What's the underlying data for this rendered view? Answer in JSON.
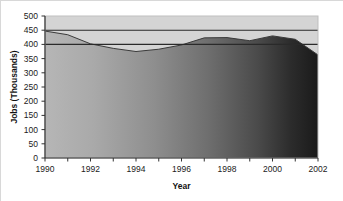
{
  "chart_data": {
    "type": "area",
    "title": "",
    "xlabel": "Year",
    "ylabel": "Jobs (Thousands)",
    "xlim": [
      1990,
      2002
    ],
    "ylim": [
      0,
      500
    ],
    "grid": false,
    "legend": "none",
    "x": [
      1990,
      1991,
      1992,
      1993,
      1994,
      1995,
      1996,
      1997,
      1998,
      1999,
      2000,
      2001,
      2002
    ],
    "values": [
      447,
      434,
      402,
      386,
      375,
      383,
      398,
      423,
      424,
      413,
      430,
      418,
      363
    ],
    "series": [
      {
        "name": "Jobs",
        "values": [
          447,
          434,
          402,
          386,
          375,
          383,
          398,
          423,
          424,
          413,
          430,
          418,
          363
        ]
      }
    ],
    "reference_lines": [
      {
        "value": 450,
        "orientation": "horizontal"
      },
      {
        "value": 400,
        "orientation": "horizontal"
      }
    ],
    "x_tick_labels": [
      "1990",
      "1992",
      "1994",
      "1996",
      "1998",
      "2000",
      "2002"
    ],
    "x_tick_values": [
      1990,
      1992,
      1994,
      1996,
      1998,
      2000,
      2002
    ],
    "x_minor_ticks": [
      1991,
      1993,
      1995,
      1997,
      1999,
      2001
    ],
    "y_tick_labels": [
      "500",
      "450",
      "400",
      "350",
      "300",
      "250",
      "200",
      "150",
      "100",
      "50",
      "0"
    ],
    "y_tick_values": [
      500,
      450,
      400,
      350,
      300,
      250,
      200,
      150,
      100,
      50,
      0
    ],
    "colors": {
      "plot_background": "#d4d4d4",
      "area_fill_start": "#b4b4b4",
      "area_fill_end": "#1d1d1d",
      "area_line": "#3a3a3a",
      "reference_line": "#2a2a2a",
      "axis": "#333333",
      "text": "#1b1b1b",
      "page_background": "#ffffff"
    }
  },
  "axes": {
    "y_title": "Jobs (Thousands)",
    "x_title": "Year"
  }
}
